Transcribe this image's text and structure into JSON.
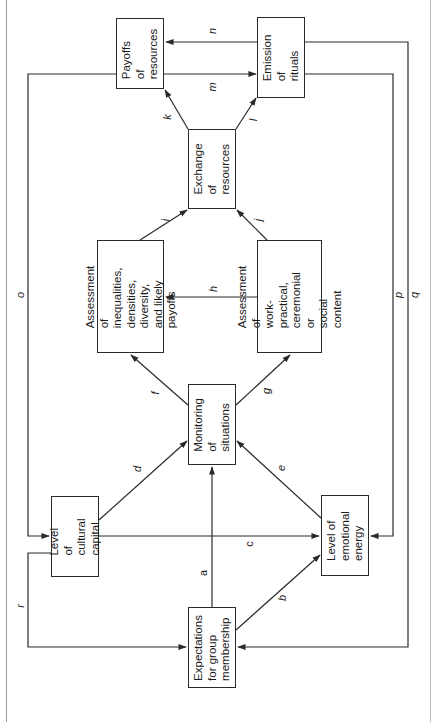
{
  "diagram": {
    "orientation": "rotated -90deg (landscape figure shown on portrait page)",
    "nodes": [
      {
        "id": "expectations",
        "label": "Expectations\nfor group\nmembership"
      },
      {
        "id": "cultural_capital",
        "label": "Level of\ncultural\ncapital"
      },
      {
        "id": "emotional_energy",
        "label": "Level of\nemotional\nenergy"
      },
      {
        "id": "monitoring",
        "label": "Monitoring of\nsituations"
      },
      {
        "id": "assess_inequalities",
        "label": "Assessment of\ninequalities,\ndensities, diversity,\nand likely payoffs"
      },
      {
        "id": "assess_content",
        "label": "Assessment of\nwork-practical,\nceremonial or\nsocial content"
      },
      {
        "id": "exchange",
        "label": "Exchange of\nresources"
      },
      {
        "id": "payoffs",
        "label": "Payoffs of\nresources"
      },
      {
        "id": "emission",
        "label": "Emission of\nrituals"
      }
    ],
    "edges": [
      {
        "label": "a",
        "from": "expectations",
        "to": "monitoring"
      },
      {
        "label": "b",
        "from": "expectations",
        "to": "emotional_energy"
      },
      {
        "label": "c",
        "from": "cultural_capital",
        "to": "emotional_energy"
      },
      {
        "label": "d",
        "from": "cultural_capital",
        "to": "monitoring"
      },
      {
        "label": "e",
        "from": "emotional_energy",
        "to": "monitoring"
      },
      {
        "label": "f",
        "from": "monitoring",
        "to": "assess_inequalities"
      },
      {
        "label": "g",
        "from": "monitoring",
        "to": "assess_content"
      },
      {
        "label": "h",
        "from": "assess_content",
        "to": "assess_inequalities"
      },
      {
        "label": "i",
        "from": "assess_inequalities",
        "to": "exchange"
      },
      {
        "label": "j",
        "from": "assess_content",
        "to": "exchange"
      },
      {
        "label": "k",
        "from": "exchange",
        "to": "payoffs"
      },
      {
        "label": "l",
        "from": "exchange",
        "to": "emission"
      },
      {
        "label": "m",
        "from": "payoffs",
        "to": "emission"
      },
      {
        "label": "n",
        "from": "emission",
        "to": "payoffs"
      },
      {
        "label": "o",
        "from": "payoffs",
        "to": "cultural_capital"
      },
      {
        "label": "p",
        "from": "emission",
        "to": "emotional_energy"
      },
      {
        "label": "q",
        "from": "emission",
        "to": "expectations"
      },
      {
        "label": "r",
        "from": "cultural_capital",
        "to": "expectations"
      }
    ],
    "colors": {
      "line": "#2a2a2a",
      "background": "#ffffff"
    }
  }
}
